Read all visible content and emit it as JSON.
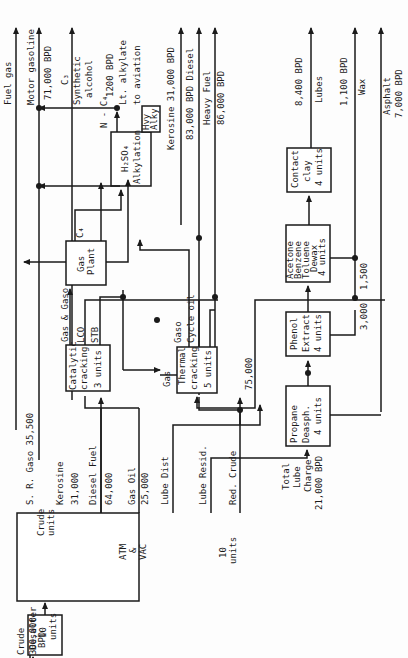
{
  "diagram": {
    "feed": {
      "label": "Crude",
      "rate": "300,000",
      "unit": "BPD"
    },
    "units": {
      "desalter": [
        "Desalter",
        "10",
        "units"
      ],
      "crude": [
        "Crude",
        "units"
      ],
      "atm_vac": [
        "ATM",
        "&",
        "VAC"
      ],
      "crude_count": [
        "10",
        "units"
      ],
      "catalytic": [
        "Catalytic",
        "cracking",
        "3 units"
      ],
      "thermal": [
        "Thermal",
        "cracking",
        "5 units"
      ],
      "gas_plant": [
        "Gas",
        "Plant"
      ],
      "alkylation": [
        "H₂SO₄",
        "Alkylation"
      ],
      "hvy_alky": [
        "Hvy",
        "Alky"
      ],
      "propane": [
        "Propane",
        "Deasph.",
        "4 units"
      ],
      "phenol": [
        "Phenol",
        "Extract",
        "4 units"
      ],
      "dewax": [
        "Acetone",
        "Benzene",
        "Toluene",
        "Dewax",
        "4 units"
      ],
      "clay": [
        "Contact",
        "clay",
        "4 units"
      ]
    },
    "streams": {
      "sr_gaso": "S. R. Gaso   35,500",
      "kerosine": "Kerosine",
      "kerosine_rate": "31,000",
      "diesel": "Diesel Fuel",
      "diesel_rate": "64,000",
      "gas_oil": "Gas Oil",
      "gas_oil_rate": "25,000",
      "lube_dist": "Lube Dist",
      "lube_resid": "Lube Resid.",
      "red_crude": "Red. Crude",
      "gas_gaso": "Gas & Gaso",
      "lco": "LCO",
      "stb": "STB",
      "c4": "C₄",
      "n_c4": "N - C₄",
      "thermal_gas": "Gas",
      "thermal_gaso": "Gaso",
      "cycle_oil": "Cycle oil",
      "r75000": "75,000",
      "r3000": "3,000",
      "r1500": "1,500",
      "total_lube": [
        "Total",
        "Lube",
        "Charge",
        "21,000 BPD"
      ]
    },
    "products": {
      "fuel_gas": "Fuel gas",
      "motor_gasoline": "Motor gasoline",
      "motor_rate": "71,000 BPD",
      "c3": "C₃",
      "synthetic_alcohol": [
        "Synthetic",
        "alcohol"
      ],
      "alkylate_rate": "1200 BPD",
      "lt_alkylate": "Lt. alkylate",
      "to_aviation": "to aviation",
      "kerosine": "Kerosine   31,000 BPD",
      "diesel": "83,000 BPD Diesel",
      "heavy_fuel": "Heavy Fuel",
      "heavy_fuel_rate": "86,000 BPD",
      "lubes_rate": "8,400 BPD",
      "lubes": "Lubes",
      "wax_rate": "1,100 BPD",
      "wax": "Wax",
      "asphalt": "Asphalt",
      "asphalt_rate": "7,000 BPD"
    }
  }
}
